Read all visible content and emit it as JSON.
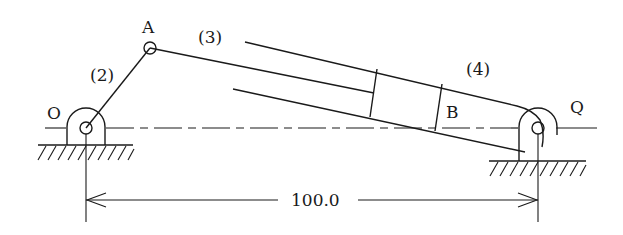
{
  "diagram": {
    "type": "mechanism-schematic",
    "colors": {
      "stroke": "#1a1a1a",
      "background": "#ffffff"
    },
    "labels": {
      "pivot_o": "O",
      "joint_a": "A",
      "point_b": "B",
      "pivot_q": "Q",
      "link_2": "(2)",
      "link_3": "(3)",
      "link_4": "(4)"
    },
    "dimension": {
      "value": "100.0",
      "from": "O",
      "to": "Q"
    },
    "components": [
      {
        "id": "ground-O",
        "type": "fixed-pivot",
        "label": "O"
      },
      {
        "id": "link-2",
        "type": "crank",
        "label": "(2)",
        "connects": [
          "O",
          "A"
        ]
      },
      {
        "id": "link-3",
        "type": "piston-rod",
        "label": "(3)",
        "connects": [
          "A",
          "B"
        ]
      },
      {
        "id": "link-4",
        "type": "cylinder",
        "label": "(4)",
        "connects": [
          "B",
          "Q"
        ]
      },
      {
        "id": "ground-Q",
        "type": "fixed-pivot",
        "label": "Q"
      }
    ]
  }
}
